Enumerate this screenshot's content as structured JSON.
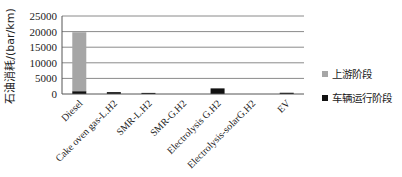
{
  "chart_data": {
    "type": "bar",
    "stacked": true,
    "title": "",
    "xlabel": "",
    "ylabel": "石油消耗/(bar/km)",
    "ylim": [
      0,
      25000
    ],
    "yticks": [
      0,
      5000,
      10000,
      15000,
      20000,
      25000
    ],
    "ytick_labels": [
      "0",
      "5000",
      "10000",
      "15000",
      "20000",
      "25000"
    ],
    "grid": true,
    "legend_position": "right",
    "categories": [
      "Diesel",
      "Cake oven gas-L.H2",
      "SMR-L.H2",
      "SMR-G.H2",
      "Electrolysis G.H2",
      "Electrolysis-solarG.H2",
      "EV"
    ],
    "series": [
      {
        "name": "车辆运行阶段",
        "color": "#111111",
        "values": [
          900,
          600,
          350,
          0,
          1800,
          0,
          400
        ]
      },
      {
        "name": "上游阶段",
        "color": "#a6a6a6",
        "values": [
          18900,
          0,
          0,
          0,
          0,
          0,
          0
        ]
      }
    ],
    "legend": [
      {
        "label": "上游阶段",
        "color": "#a6a6a6"
      },
      {
        "label": "车辆运行阶段",
        "color": "#111111"
      }
    ]
  }
}
